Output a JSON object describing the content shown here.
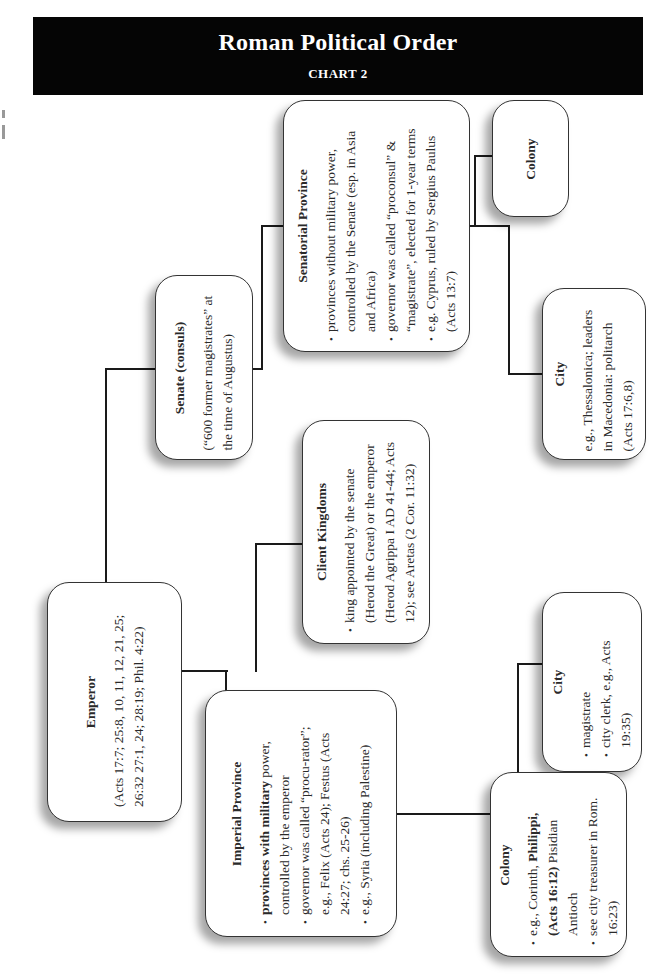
{
  "header": {
    "title": "Roman Political Order",
    "subtitle": "CHART 2"
  },
  "nodes": {
    "emperor": {
      "title": "Emperor",
      "note": "(Acts 17:7; 25:8, 10, 11, 12, 21, 25; 26:32 27:1, 24; 28:19; Phil. 4:22)"
    },
    "senate": {
      "title": "Senate (consuls)",
      "note": "(“600 former magistrates” at the time of Augustus)"
    },
    "senatorial_province": {
      "title": "Senatorial Province",
      "bullets": [
        "provinces without military power, controlled by the Senate (esp. in Asia and Africa)",
        "governor was called “proconsul” & “magistrate”, elected for 1-year terms",
        "e.g. Cyprus, ruled by Sergius Paulus (Acts 13:7)"
      ]
    },
    "senatorial_colony": {
      "title": "Colony"
    },
    "senatorial_city": {
      "title": "City",
      "note": "e.g., Thessalonica; leaders in Macedonia: politarch (Acts 17:6,8)"
    },
    "client_kingdoms": {
      "title": "Client Kingdoms",
      "bullets": [
        "king appointed by the senate (Herod the Great) or the emperor (Herod Agrippa I AD 41-44; Acts 12); see Aretas (2 Cor. 11:32)"
      ]
    },
    "imperial_province": {
      "title": "Imperial Province",
      "bullets_bold_lead": "provinces with military",
      "bullets": [
        " power, controlled by the emperor",
        "governor was called “procu-rator”; e.g., Felix (Acts 24); Festus (Acts 24:27; chs. 25-26)",
        "e.g., Syria (including Palestine)"
      ]
    },
    "imperial_city": {
      "title": "City",
      "bullets": [
        "magistrate",
        "city clerk, e.g., Acts 19:35)"
      ]
    },
    "imperial_colony": {
      "title": "Colony",
      "bullet1_pre": "e.g., Corinth, ",
      "bullet1_bold": "Philippi, (Acts 16:12)",
      "bullet1_post": " Pisidian Antioch",
      "bullets": [
        "see city treasurer in Rom. 16:23)"
      ]
    }
  }
}
